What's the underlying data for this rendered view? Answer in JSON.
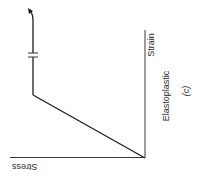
{
  "diagram": {
    "type": "stress-strain",
    "orientation": "rotated",
    "labels": {
      "stress_axis": "Stress",
      "strain_axis": "Strain",
      "model": "Elastoplastic",
      "panel": "(c)"
    },
    "colors": {
      "line": "#1e1e1e",
      "axis": "#3a3a3a",
      "background": "#ffffff"
    },
    "segments": [
      {
        "name": "elastic",
        "description": "linear rise from origin to yield point"
      },
      {
        "name": "plastic",
        "description": "horizontal (perfectly plastic) plateau with break marks and arrow"
      }
    ]
  }
}
